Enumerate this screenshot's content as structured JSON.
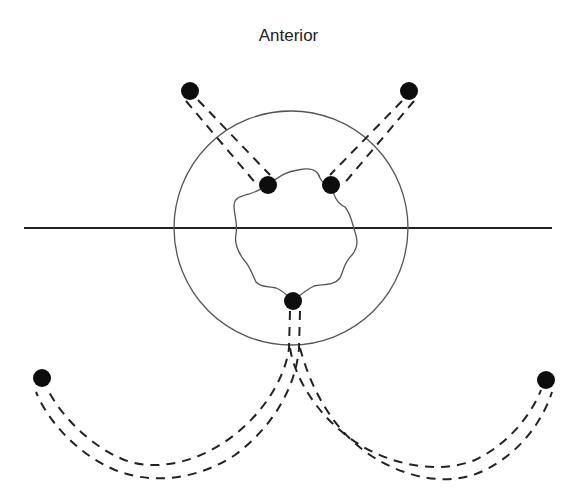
{
  "diagram": {
    "title": "Anterior",
    "colors": {
      "background": "#ffffff",
      "line": "#222222",
      "thin_line": "#555555",
      "dot": "#0d0d0d"
    },
    "midline": {
      "x1": 24,
      "y1": 228,
      "x2": 552,
      "y2": 228
    },
    "outer_circle": {
      "cx": 291,
      "cy": 228,
      "r": 117
    },
    "inner_outline": "wavy closed contour",
    "dots": [
      {
        "id": "top-left-external",
        "cx": 190,
        "cy": 91,
        "r": 9
      },
      {
        "id": "top-right-external",
        "cx": 409,
        "cy": 91,
        "r": 9
      },
      {
        "id": "inner-left",
        "cx": 268,
        "cy": 185,
        "r": 9
      },
      {
        "id": "inner-right",
        "cx": 331,
        "cy": 185,
        "r": 9
      },
      {
        "id": "inner-bottom",
        "cx": 293,
        "cy": 301,
        "r": 9
      },
      {
        "id": "bottom-left-external",
        "cx": 42,
        "cy": 378,
        "r": 9
      },
      {
        "id": "bottom-right-external",
        "cx": 546,
        "cy": 380,
        "r": 9
      }
    ],
    "dashed_tracts": [
      {
        "id": "tract-top-left",
        "from": "top-left-external",
        "to": "inner-left"
      },
      {
        "id": "tract-top-right",
        "from": "top-right-external",
        "to": "inner-right"
      },
      {
        "id": "tract-bottom-left",
        "from": "inner-bottom",
        "to": "bottom-left-external"
      },
      {
        "id": "tract-bottom-right",
        "from": "inner-bottom",
        "to": "bottom-right-external"
      }
    ]
  }
}
